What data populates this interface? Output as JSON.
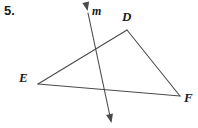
{
  "problem": {
    "number": "5."
  },
  "figure": {
    "type": "geometry-diagram",
    "stroke_color": "#4a4a4a",
    "background_color": "#ffffff",
    "label_color": "#1a1a1a",
    "stroke_width": 1.1,
    "vertices": {
      "D": {
        "x": 127,
        "y": 30,
        "label": "D",
        "label_x": 122,
        "label_y": 10
      },
      "E": {
        "x": 38,
        "y": 84,
        "label": "E",
        "label_x": 19,
        "label_y": 71
      },
      "F": {
        "x": 180,
        "y": 96,
        "label": "F",
        "label_x": 184,
        "label_y": 91
      }
    },
    "segments": [
      {
        "name": "ED",
        "from": "E",
        "to": "D"
      },
      {
        "name": "DF",
        "from": "D",
        "to": "F"
      },
      {
        "name": "EF",
        "from": "E",
        "to": "F"
      }
    ],
    "line_m": {
      "label": "m",
      "label_x": 92,
      "label_y": 5,
      "x1": 88,
      "y1": 13,
      "x2": 111,
      "y2": 121,
      "arrow_start": true,
      "arrow_end": true,
      "intersects": [
        {
          "segment": "ED",
          "x": 97,
          "y": 47
        },
        {
          "segment": "EF",
          "x": 106,
          "y": 90
        }
      ]
    }
  }
}
